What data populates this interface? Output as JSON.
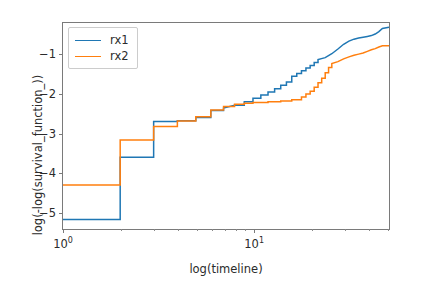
{
  "chart_data": {
    "type": "line",
    "title": "",
    "xlabel": "log(timeline)",
    "ylabel": "log(-log(survival_function_))",
    "xscale": "log",
    "xlim": [
      1.0,
      52.0
    ],
    "ylim": [
      -5.45,
      -0.22
    ],
    "grid": false,
    "legend_position": "upper left",
    "drawstyle": "steps-post",
    "xticks": [
      {
        "value": 1,
        "label": "10",
        "exp": "0"
      },
      {
        "value": 10,
        "label": "10",
        "exp": "1"
      }
    ],
    "xminorticks": [
      2,
      3,
      4,
      5,
      6,
      7,
      8,
      9,
      20,
      30,
      40,
      50
    ],
    "yticks": [
      -1,
      -2,
      -3,
      -4,
      -5
    ],
    "ytick_labels": [
      "−1",
      "−2",
      "−3",
      "−4",
      "−5"
    ],
    "series": [
      {
        "name": "rx1",
        "color": "#1f77b4",
        "points": [
          [
            1.0,
            -5.21
          ],
          [
            2.0,
            -5.21
          ],
          [
            2.0,
            -3.63
          ],
          [
            3.0,
            -3.63
          ],
          [
            3.0,
            -2.72
          ],
          [
            4.0,
            -2.72
          ],
          [
            4.0,
            -2.7
          ],
          [
            5.0,
            -2.7
          ],
          [
            5.0,
            -2.62
          ],
          [
            6.0,
            -2.62
          ],
          [
            6.0,
            -2.44
          ],
          [
            7.0,
            -2.44
          ],
          [
            7.0,
            -2.38
          ],
          [
            8.0,
            -2.31
          ],
          [
            9.0,
            -2.31
          ],
          [
            9.0,
            -2.22
          ],
          [
            10.0,
            -2.22
          ],
          [
            10.0,
            -2.13
          ],
          [
            11.0,
            -2.13
          ],
          [
            11.0,
            -2.05
          ],
          [
            12.0,
            -2.05
          ],
          [
            12.0,
            -1.97
          ],
          [
            13.0,
            -1.97
          ],
          [
            13.0,
            -1.89
          ],
          [
            14.0,
            -1.89
          ],
          [
            14.0,
            -1.8
          ],
          [
            15.0,
            -1.8
          ],
          [
            15.0,
            -1.72
          ],
          [
            16.0,
            -1.72
          ],
          [
            16.0,
            -1.57
          ],
          [
            17.0,
            -1.57
          ],
          [
            17.0,
            -1.5
          ],
          [
            18.0,
            -1.5
          ],
          [
            18.0,
            -1.43
          ],
          [
            19.0,
            -1.43
          ],
          [
            19.0,
            -1.36
          ],
          [
            20.0,
            -1.36
          ],
          [
            20.0,
            -1.3
          ],
          [
            21.0,
            -1.3
          ],
          [
            21.0,
            -1.22
          ],
          [
            22.0,
            -1.22
          ],
          [
            22.0,
            -1.15
          ],
          [
            24.0,
            -1.1
          ],
          [
            26.0,
            -1.0
          ],
          [
            28.0,
            -0.88
          ],
          [
            30.0,
            -0.76
          ],
          [
            32.0,
            -0.68
          ],
          [
            34.0,
            -0.63
          ],
          [
            36.0,
            -0.6
          ],
          [
            38.0,
            -0.58
          ],
          [
            40.0,
            -0.56
          ],
          [
            42.0,
            -0.54
          ],
          [
            44.0,
            -0.5
          ],
          [
            46.0,
            -0.44
          ],
          [
            48.0,
            -0.36
          ],
          [
            52.0,
            -0.33
          ]
        ]
      },
      {
        "name": "rx2",
        "color": "#ff7f0e",
        "points": [
          [
            1.0,
            -4.33
          ],
          [
            2.0,
            -4.33
          ],
          [
            2.0,
            -3.19
          ],
          [
            3.0,
            -3.19
          ],
          [
            3.0,
            -2.85
          ],
          [
            4.0,
            -2.85
          ],
          [
            4.0,
            -2.71
          ],
          [
            5.0,
            -2.71
          ],
          [
            5.0,
            -2.6
          ],
          [
            6.0,
            -2.6
          ],
          [
            6.0,
            -2.43
          ],
          [
            7.0,
            -2.43
          ],
          [
            7.0,
            -2.34
          ],
          [
            8.0,
            -2.34
          ],
          [
            8.0,
            -2.28
          ],
          [
            9.0,
            -2.28
          ],
          [
            9.0,
            -2.26
          ],
          [
            10.0,
            -2.26
          ],
          [
            10.0,
            -2.24
          ],
          [
            12.0,
            -2.24
          ],
          [
            12.0,
            -2.22
          ],
          [
            14.0,
            -2.22
          ],
          [
            14.0,
            -2.2
          ],
          [
            16.0,
            -2.2
          ],
          [
            16.0,
            -2.17
          ],
          [
            18.0,
            -2.17
          ],
          [
            18.0,
            -2.1
          ],
          [
            19.0,
            -2.1
          ],
          [
            19.0,
            -2.02
          ],
          [
            20.0,
            -2.02
          ],
          [
            20.0,
            -1.95
          ],
          [
            21.0,
            -1.95
          ],
          [
            21.0,
            -1.85
          ],
          [
            22.0,
            -1.85
          ],
          [
            22.0,
            -1.74
          ],
          [
            23.0,
            -1.74
          ],
          [
            23.0,
            -1.62
          ],
          [
            24.0,
            -1.62
          ],
          [
            24.0,
            -1.48
          ],
          [
            25.0,
            -1.48
          ],
          [
            25.0,
            -1.35
          ],
          [
            26.0,
            -1.35
          ],
          [
            26.0,
            -1.25
          ],
          [
            28.0,
            -1.2
          ],
          [
            30.0,
            -1.13
          ],
          [
            32.0,
            -1.08
          ],
          [
            34.0,
            -1.04
          ],
          [
            36.0,
            -1.01
          ],
          [
            38.0,
            -0.98
          ],
          [
            40.0,
            -0.94
          ],
          [
            42.0,
            -0.9
          ],
          [
            44.0,
            -0.87
          ],
          [
            46.0,
            -0.83
          ],
          [
            48.0,
            -0.8
          ],
          [
            52.0,
            -0.8
          ]
        ]
      }
    ]
  },
  "legend": {
    "entries": [
      {
        "label": "rx1",
        "color": "#1f77b4"
      },
      {
        "label": "rx2",
        "color": "#ff7f0e"
      }
    ]
  },
  "axis_labels": {
    "x": "log(timeline)",
    "y": "log(-log(survival_function_))"
  }
}
